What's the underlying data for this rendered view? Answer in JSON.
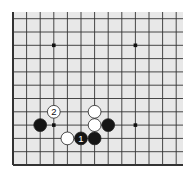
{
  "board": {
    "background": "#e8e8e8",
    "line_color": "#333333",
    "edge_color": "#222222",
    "origin_x": 13,
    "origin_y": 165,
    "spacing_x": 13.6,
    "spacing_y": 13.3,
    "cols": 13,
    "rows": 12,
    "edges": [
      "left",
      "bottom"
    ],
    "hoshi": [
      [
        3,
        9
      ],
      [
        9,
        9
      ],
      [
        3,
        3
      ],
      [
        9,
        3
      ]
    ]
  },
  "stones": [
    {
      "color": "white",
      "col": 6,
      "row": 4,
      "label": ""
    },
    {
      "color": "white",
      "col": 6,
      "row": 3,
      "label": ""
    },
    {
      "color": "black",
      "col": 7,
      "row": 3,
      "label": ""
    },
    {
      "color": "black",
      "col": 2,
      "row": 3,
      "label": ""
    },
    {
      "color": "white",
      "col": 3,
      "row": 4,
      "label": "2"
    },
    {
      "color": "white",
      "col": 4,
      "row": 2,
      "label": ""
    },
    {
      "color": "black",
      "col": 5,
      "row": 2,
      "label": "1"
    },
    {
      "color": "black",
      "col": 6,
      "row": 2,
      "label": ""
    }
  ]
}
